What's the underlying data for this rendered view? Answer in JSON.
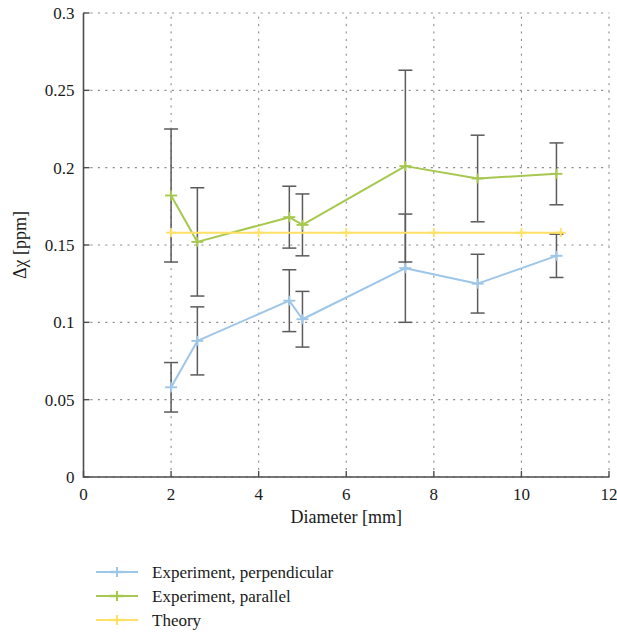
{
  "chart_data": {
    "type": "line",
    "title": "",
    "xlabel": "Diameter [mm]",
    "ylabel": "Δχ [ppm]",
    "xlim": [
      0,
      12
    ],
    "ylim": [
      0,
      0.3
    ],
    "xticks": [
      "0",
      "2",
      "4",
      "6",
      "8",
      "10",
      "12"
    ],
    "xtick_values": [
      0,
      2,
      4,
      6,
      8,
      10,
      12
    ],
    "yticks": [
      "0",
      "0.05",
      "0.1",
      "0.15",
      "0.2",
      "0.25",
      "0.3"
    ],
    "ytick_values": [
      0,
      0.05,
      0.1,
      0.15,
      0.2,
      0.25,
      0.3
    ],
    "grid": true,
    "grid_style": "dotted",
    "legend_position": "below-axes-left",
    "series": [
      {
        "name": "Experiment, perpendicular",
        "color": "#9ec6e8",
        "x": [
          2.0,
          2.6,
          4.7,
          5.0,
          7.35,
          9.0,
          10.8
        ],
        "values": [
          0.058,
          0.088,
          0.114,
          0.102,
          0.135,
          0.125,
          0.143
        ],
        "yerr": [
          0.016,
          0.022,
          0.02,
          0.018,
          0.035,
          0.019,
          0.014
        ]
      },
      {
        "name": "Experiment, parallel",
        "color": "#a6c84f",
        "x": [
          2.0,
          2.6,
          4.7,
          5.0,
          7.35,
          9.0,
          10.8
        ],
        "values": [
          0.182,
          0.152,
          0.168,
          0.163,
          0.201,
          0.193,
          0.196
        ],
        "yerr": [
          0.043,
          0.035,
          0.02,
          0.02,
          0.062,
          0.028,
          0.02
        ]
      },
      {
        "name": "Theory",
        "color": "#ffe066",
        "x": [
          2.0,
          10.9
        ],
        "values": [
          0.158,
          0.158
        ],
        "yerr": [
          0,
          0
        ]
      }
    ]
  },
  "legend": {
    "entries": [
      {
        "label": "Experiment, perpendicular",
        "color": "#9ec6e8"
      },
      {
        "label": "Experiment, parallel",
        "color": "#a6c84f"
      },
      {
        "label": "Theory",
        "color": "#ffe066"
      }
    ]
  },
  "axes": {
    "x_title": "Diameter [mm]",
    "y_title": "Δχ [ppm]"
  }
}
